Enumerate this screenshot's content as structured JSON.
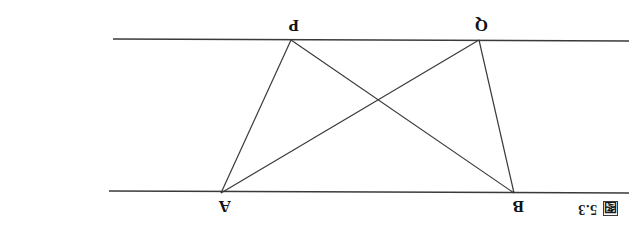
{
  "page": {
    "width": 636,
    "height": 225,
    "background": "#ffffff",
    "orientation": "upside-down-scan",
    "ink_color": "#333333"
  },
  "caption": {
    "marker_glyph": "图",
    "marker_name": "figure-cjk-character",
    "number": "5.3"
  },
  "figure": {
    "name": "two-parallel-lines-with-crossing-triangles",
    "lines": [
      {
        "name": "upper-parallel-line",
        "x1": 7,
        "y1": 32,
        "x2": 527,
        "y2": 34
      },
      {
        "name": "lower-parallel-line",
        "x1": 7,
        "y1": 184,
        "x2": 523,
        "y2": 186
      }
    ],
    "vertices": [
      {
        "label": "B",
        "x": 122,
        "y": 32,
        "label_x": 112,
        "label_y": 10,
        "position": "upper-left"
      },
      {
        "label": "A",
        "x": 415,
        "y": 32,
        "label_x": 405,
        "label_y": 10,
        "position": "upper-right"
      },
      {
        "label": "Q",
        "x": 157,
        "y": 185,
        "label_x": 148,
        "label_y": 192,
        "position": "lower-left"
      },
      {
        "label": "P",
        "x": 345,
        "y": 185,
        "label_x": 337,
        "label_y": 192,
        "position": "lower-right"
      }
    ],
    "segments": [
      {
        "name": "segment-B-Q",
        "from": "B",
        "to": "Q",
        "x1": 122,
        "y1": 32,
        "x2": 157,
        "y2": 185
      },
      {
        "name": "segment-B-P",
        "from": "B",
        "to": "P",
        "x1": 122,
        "y1": 32,
        "x2": 345,
        "y2": 185
      },
      {
        "name": "segment-A-Q",
        "from": "A",
        "to": "Q",
        "x1": 415,
        "y1": 32,
        "x2": 157,
        "y2": 185
      },
      {
        "name": "segment-A-P",
        "from": "A",
        "to": "P",
        "x1": 415,
        "y1": 32,
        "x2": 345,
        "y2": 185
      }
    ],
    "intersection": {
      "name": "diagonal-crossing-point",
      "x": 258,
      "y": 125
    }
  },
  "bleed_text": ""
}
